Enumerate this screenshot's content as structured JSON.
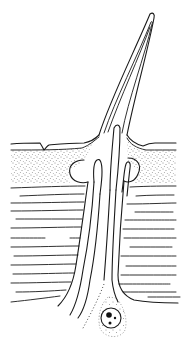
{
  "figure": {
    "title": "",
    "labels": [],
    "colors": {
      "ink": "#1a1a1a",
      "background": "#ffffff"
    },
    "parts": [
      {
        "id": "hair-shaft",
        "name": "Hair shaft"
      },
      {
        "id": "socket",
        "name": "Socket membrane"
      },
      {
        "id": "epicuticle",
        "name": "Outer cuticle surface"
      },
      {
        "id": "exocuticle",
        "name": "Stippled cuticle layer"
      },
      {
        "id": "endocuticle",
        "name": "Laminated cuticle layer"
      },
      {
        "id": "cell-process",
        "name": "Cell process / canal"
      },
      {
        "id": "nucleus",
        "name": "Cell with nucleus"
      }
    ]
  }
}
